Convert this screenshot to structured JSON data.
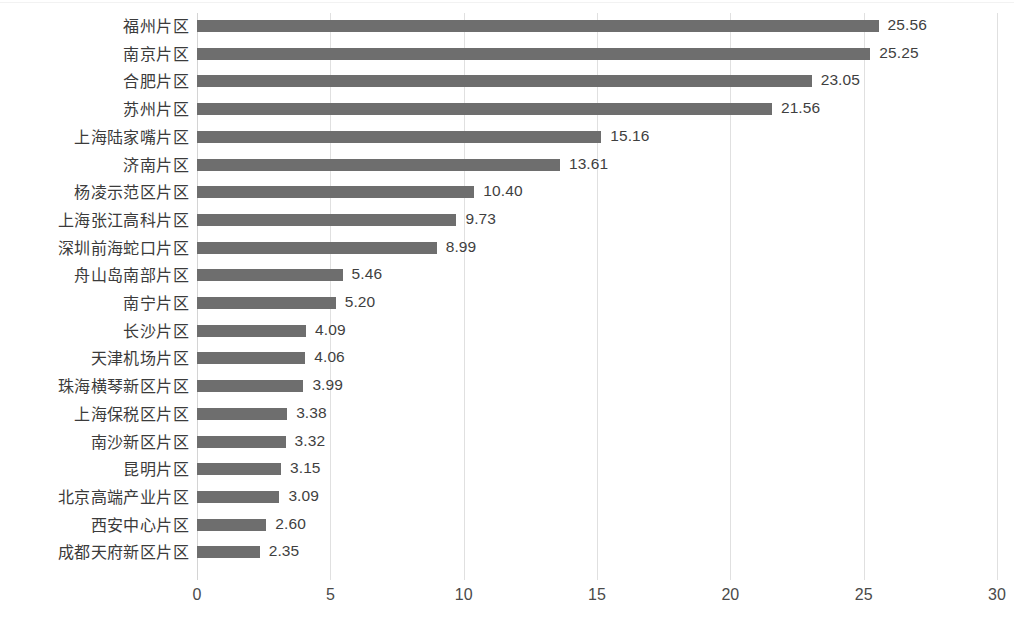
{
  "chart_data": {
    "type": "bar",
    "orientation": "horizontal",
    "title": "",
    "subtitle": "",
    "xlabel": "",
    "ylabel": "",
    "xlim": [
      0,
      30
    ],
    "xticks": [
      "0",
      "5",
      "10",
      "15",
      "20",
      "25",
      "30"
    ],
    "grid": "vertical",
    "legend": "none",
    "bar_color": "#6e6e6e",
    "gridline_color": "#e0e0e0",
    "label_color": "#3b3b3b",
    "value_label_format": "0.00",
    "categories": [
      "福州片区",
      "南京片区",
      "合肥片区",
      "苏州片区",
      "上海陆家嘴片区",
      "济南片区",
      "杨凌示范区片区",
      "上海张江高科片区",
      "深圳前海蛇口片区",
      "舟山岛南部片区",
      "南宁片区",
      "长沙片区",
      "天津机场片区",
      "珠海横琴新区片区",
      "上海保税区片区",
      "南沙新区片区",
      "昆明片区",
      "北京高端产业片区",
      "西安中心片区",
      "成都天府新区片区"
    ],
    "values": [
      25.56,
      25.25,
      23.05,
      21.56,
      15.16,
      13.61,
      10.4,
      9.73,
      8.99,
      5.46,
      5.2,
      4.09,
      4.06,
      3.99,
      3.38,
      3.32,
      3.15,
      3.09,
      2.6,
      2.35
    ],
    "value_labels": [
      "25.56",
      "25.25",
      "23.05",
      "21.56",
      "15.16",
      "13.61",
      "10.40",
      "9.73",
      "8.99",
      "5.46",
      "5.20",
      "4.09",
      "4.06",
      "3.99",
      "3.38",
      "3.32",
      "3.15",
      "3.09",
      "2.60",
      "2.35"
    ]
  }
}
